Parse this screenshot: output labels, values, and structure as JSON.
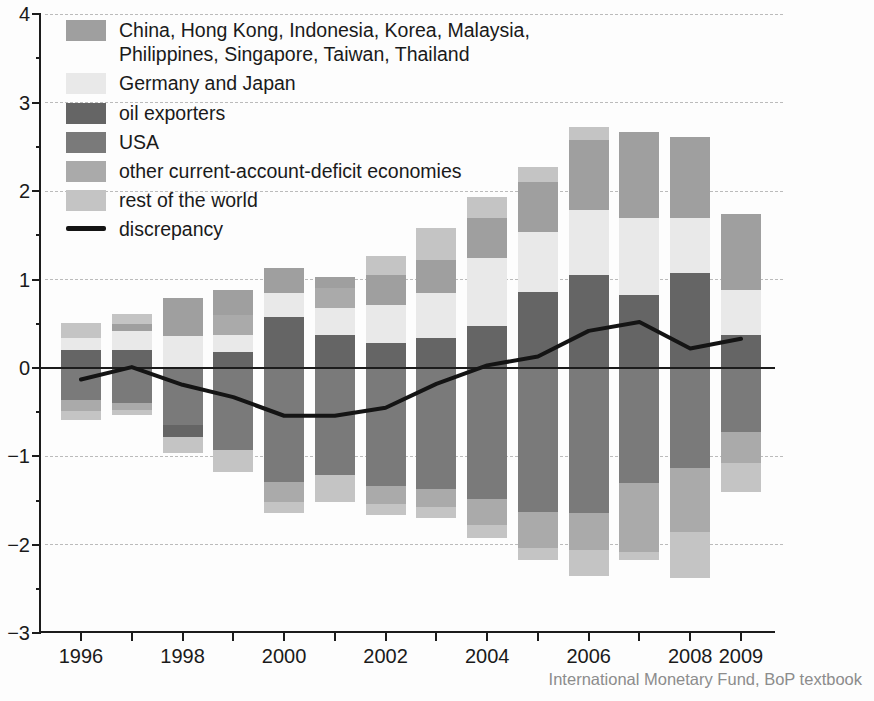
{
  "source_note": "International Monetary Fund, BoP textbook",
  "colors": {
    "china_group": "#9f9f9f",
    "germany_japan": "#e9e9e9",
    "oil_exporters": "#656565",
    "usa": "#7a7a7a",
    "other_deficit": "#aaaaaa",
    "rest_of_world": "#c4c4c4",
    "discrepancy": "#141414",
    "grid": "#bbbbbb",
    "axis": "#1c1c1c",
    "source_text": "#8c8c8c"
  },
  "legend": {
    "items": [
      {
        "series": "china_group",
        "label_line1": "China, Hong Kong, Indonesia, Korea, Malaysia,",
        "label_line2": "Philippines, Singapore, Taiwan, Thailand"
      },
      {
        "series": "germany_japan",
        "label": "Germany and Japan"
      },
      {
        "series": "oil_exporters",
        "label": "oil exporters"
      },
      {
        "series": "usa",
        "label": "USA"
      },
      {
        "series": "other_deficit",
        "label": "other current-account-deficit economies"
      },
      {
        "series": "rest_of_world",
        "label": "rest of the world"
      },
      {
        "series": "discrepancy",
        "label": "discrepancy"
      }
    ]
  },
  "chart_data": {
    "type": "stacked-bar-with-line",
    "title": "",
    "xlabel": "",
    "ylabel": "",
    "years": [
      1996,
      1997,
      1998,
      1999,
      2000,
      2001,
      2002,
      2003,
      2004,
      2005,
      2006,
      2007,
      2008,
      2009
    ],
    "ylim": [
      -3,
      4
    ],
    "yticks": [
      4,
      3,
      2,
      1,
      0,
      -1,
      -2,
      -3
    ],
    "ytick_labels": [
      "4",
      "3",
      "2",
      "1",
      "0",
      "−1",
      "−2",
      "−3"
    ],
    "yticks_minor": [
      3.5,
      2.5,
      1.5,
      0.5,
      -0.5,
      -1.5,
      -2.5
    ],
    "gridlines_dashed": [
      4,
      3,
      2,
      1,
      -1,
      -2
    ],
    "xtick_labels": [
      "1996",
      "",
      "1998",
      "",
      "2000",
      "",
      "2002",
      "",
      "2004",
      "",
      "2006",
      "",
      "2008",
      "2009"
    ],
    "legend_position": "top-left",
    "bars": [
      {
        "year": 1996,
        "segments": [
          {
            "series": "oil_exporters",
            "value": 0.2
          },
          {
            "series": "germany_japan",
            "value": 0.14
          },
          {
            "series": "rest_of_world",
            "value": 0.17
          },
          {
            "series": "usa",
            "value": -0.36
          },
          {
            "series": "other_deficit",
            "value": -0.13
          },
          {
            "series": "rest_of_world",
            "value": -0.1
          }
        ]
      },
      {
        "year": 1997,
        "segments": [
          {
            "series": "oil_exporters",
            "value": 0.2
          },
          {
            "series": "germany_japan",
            "value": 0.22
          },
          {
            "series": "china_group",
            "value": 0.08
          },
          {
            "series": "rest_of_world",
            "value": 0.11
          },
          {
            "series": "usa",
            "value": -0.4
          },
          {
            "series": "other_deficit",
            "value": -0.08
          },
          {
            "series": "rest_of_world",
            "value": -0.05
          }
        ]
      },
      {
        "year": 1998,
        "segments": [
          {
            "series": "germany_japan",
            "value": 0.36
          },
          {
            "series": "china_group",
            "value": 0.43
          },
          {
            "series": "usa",
            "value": -0.64
          },
          {
            "series": "oil_exporters",
            "value": -0.14
          },
          {
            "series": "rest_of_world",
            "value": -0.18
          }
        ]
      },
      {
        "year": 1999,
        "segments": [
          {
            "series": "oil_exporters",
            "value": 0.18
          },
          {
            "series": "germany_japan",
            "value": 0.19
          },
          {
            "series": "other_deficit",
            "value": 0.23
          },
          {
            "series": "china_group",
            "value": 0.28
          },
          {
            "series": "usa",
            "value": -0.93
          },
          {
            "series": "rest_of_world",
            "value": -0.25
          }
        ]
      },
      {
        "year": 2000,
        "segments": [
          {
            "series": "oil_exporters",
            "value": 0.58
          },
          {
            "series": "germany_japan",
            "value": 0.27
          },
          {
            "series": "china_group",
            "value": 0.28
          },
          {
            "series": "usa",
            "value": -1.29
          },
          {
            "series": "other_deficit",
            "value": -0.22
          },
          {
            "series": "rest_of_world",
            "value": -0.13
          }
        ]
      },
      {
        "year": 2001,
        "segments": [
          {
            "series": "oil_exporters",
            "value": 0.37
          },
          {
            "series": "germany_japan",
            "value": 0.31
          },
          {
            "series": "other_deficit",
            "value": 0.23
          },
          {
            "series": "china_group",
            "value": 0.12
          },
          {
            "series": "usa",
            "value": -1.21
          },
          {
            "series": "rest_of_world",
            "value": -0.3
          }
        ]
      },
      {
        "year": 2002,
        "segments": [
          {
            "series": "oil_exporters",
            "value": 0.28
          },
          {
            "series": "germany_japan",
            "value": 0.43
          },
          {
            "series": "china_group",
            "value": 0.34
          },
          {
            "series": "rest_of_world",
            "value": 0.22
          },
          {
            "series": "usa",
            "value": -1.34
          },
          {
            "series": "other_deficit",
            "value": -0.2
          },
          {
            "series": "rest_of_world",
            "value": -0.12
          }
        ]
      },
      {
        "year": 2003,
        "segments": [
          {
            "series": "oil_exporters",
            "value": 0.34
          },
          {
            "series": "germany_japan",
            "value": 0.51
          },
          {
            "series": "china_group",
            "value": 0.37
          },
          {
            "series": "rest_of_world",
            "value": 0.36
          },
          {
            "series": "usa",
            "value": -1.37
          },
          {
            "series": "other_deficit",
            "value": -0.2
          },
          {
            "series": "rest_of_world",
            "value": -0.13
          }
        ]
      },
      {
        "year": 2004,
        "segments": [
          {
            "series": "oil_exporters",
            "value": 0.48
          },
          {
            "series": "germany_japan",
            "value": 0.76
          },
          {
            "series": "china_group",
            "value": 0.46
          },
          {
            "series": "rest_of_world",
            "value": 0.23
          },
          {
            "series": "usa",
            "value": -1.48
          },
          {
            "series": "other_deficit",
            "value": -0.3
          },
          {
            "series": "rest_of_world",
            "value": -0.14
          }
        ]
      },
      {
        "year": 2005,
        "segments": [
          {
            "series": "oil_exporters",
            "value": 0.86
          },
          {
            "series": "germany_japan",
            "value": 0.68
          },
          {
            "series": "china_group",
            "value": 0.56
          },
          {
            "series": "rest_of_world",
            "value": 0.17
          },
          {
            "series": "usa",
            "value": -1.63
          },
          {
            "series": "other_deficit",
            "value": -0.4
          },
          {
            "series": "rest_of_world",
            "value": -0.14
          }
        ]
      },
      {
        "year": 2006,
        "segments": [
          {
            "series": "oil_exporters",
            "value": 1.05
          },
          {
            "series": "germany_japan",
            "value": 0.74
          },
          {
            "series": "china_group",
            "value": 0.79
          },
          {
            "series": "rest_of_world",
            "value": 0.14
          },
          {
            "series": "usa",
            "value": -1.64
          },
          {
            "series": "other_deficit",
            "value": -0.42
          },
          {
            "series": "rest_of_world",
            "value": -0.29
          }
        ]
      },
      {
        "year": 2007,
        "segments": [
          {
            "series": "oil_exporters",
            "value": 0.83
          },
          {
            "series": "germany_japan",
            "value": 0.87
          },
          {
            "series": "china_group",
            "value": 0.97
          },
          {
            "series": "usa",
            "value": -1.3
          },
          {
            "series": "other_deficit",
            "value": -0.78
          },
          {
            "series": "rest_of_world",
            "value": -0.09
          }
        ]
      },
      {
        "year": 2008,
        "segments": [
          {
            "series": "oil_exporters",
            "value": 1.07
          },
          {
            "series": "germany_japan",
            "value": 0.63
          },
          {
            "series": "china_group",
            "value": 0.91
          },
          {
            "series": "usa",
            "value": -1.13
          },
          {
            "series": "other_deficit",
            "value": -0.72
          },
          {
            "series": "rest_of_world",
            "value": -0.53
          }
        ]
      },
      {
        "year": 2009,
        "segments": [
          {
            "series": "oil_exporters",
            "value": 0.37
          },
          {
            "series": "germany_japan",
            "value": 0.51
          },
          {
            "series": "china_group",
            "value": 0.86
          },
          {
            "series": "usa",
            "value": -0.72
          },
          {
            "series": "other_deficit",
            "value": -0.35
          },
          {
            "series": "rest_of_world",
            "value": -0.33
          }
        ]
      }
    ],
    "line": {
      "series": "discrepancy",
      "values": [
        -0.13,
        0.01,
        -0.19,
        -0.33,
        -0.54,
        -0.54,
        -0.45,
        -0.18,
        0.03,
        0.13,
        0.42,
        0.52,
        0.22,
        0.33
      ]
    }
  }
}
